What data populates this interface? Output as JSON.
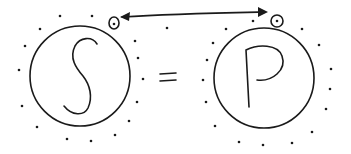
{
  "diagram": {
    "left_node": {
      "label": "S",
      "cx": 80,
      "cy": 76,
      "r": 50
    },
    "right_node": {
      "label": "P",
      "cx": 264,
      "cy": 78,
      "r": 50
    },
    "operator": "=",
    "connector": {
      "type": "double-headed-arrow",
      "from": "left-marker",
      "to": "right-marker"
    },
    "left_marker": {
      "cx": 114,
      "cy": 23
    },
    "right_marker": {
      "cx": 277,
      "cy": 21
    },
    "colors": {
      "ink": "#1a1a1a",
      "background": "#ffffff"
    }
  }
}
